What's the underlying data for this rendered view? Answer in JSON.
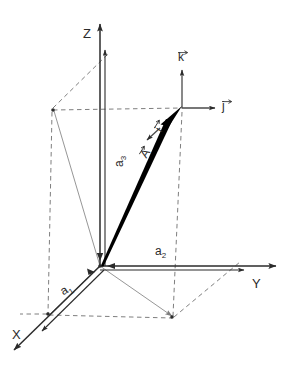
{
  "figure": {
    "background_color": "#ffffff",
    "axes": {
      "x_label": "X",
      "y_label": "Y",
      "z_label": "Z"
    },
    "unit_vectors": {
      "i_label": "i",
      "j_label": "j",
      "k_label": "k"
    },
    "components": {
      "a1_label": "a",
      "a1_sub": "1",
      "a2_label": "a",
      "a2_sub": "2",
      "a3_label": "a",
      "a3_sub": "3"
    },
    "vector": {
      "a_label": "A"
    },
    "colors": {
      "line": "#2b2b2b",
      "vector_bold": "#000000",
      "projection_gray": "#8a8a8a",
      "dashed_gray": "#6f6f6f",
      "text": "#2b2b2b"
    }
  }
}
